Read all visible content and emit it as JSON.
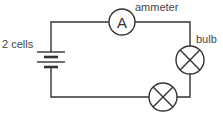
{
  "diagram": {
    "type": "circuit",
    "labels": {
      "cells": "2 cells",
      "ammeter": "ammeter",
      "bulb": "bulb",
      "ammeter_symbol": "A"
    },
    "components": [
      {
        "id": "battery",
        "kind": "2 cells"
      },
      {
        "id": "ammeter",
        "kind": "ammeter",
        "symbol": "A"
      },
      {
        "id": "bulb-1",
        "kind": "bulb"
      },
      {
        "id": "bulb-2",
        "kind": "bulb"
      }
    ],
    "colors": {
      "line": "#333333",
      "text": "#444444"
    }
  }
}
